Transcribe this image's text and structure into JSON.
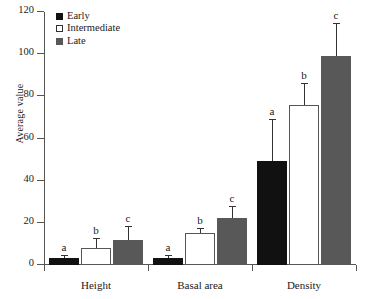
{
  "chart_data": {
    "type": "bar",
    "title": "",
    "xlabel": "",
    "ylabel": "Average value",
    "ylim": [
      0,
      120
    ],
    "ytick_values": [
      0,
      20,
      40,
      60,
      80,
      100,
      120
    ],
    "ytick_labels": [
      "0",
      "20",
      "40",
      "60",
      "80",
      "100",
      "120"
    ],
    "grid": false,
    "legend_position": "top-left",
    "categories": [
      "Height",
      "Basal area",
      "Density"
    ],
    "series": [
      {
        "name": "Early",
        "color": "#111111",
        "values": [
          3.5,
          3.5,
          49.5
        ],
        "errors_upper": [
          0.8,
          0.8,
          19.5
        ],
        "annotations": [
          "a",
          "a",
          "a"
        ]
      },
      {
        "name": "Intermediate",
        "color": "#ffffff",
        "values": [
          8.3,
          15.0,
          76.0
        ],
        "errors_upper": [
          4.0,
          2.3,
          10.0
        ],
        "annotations": [
          "b",
          "b",
          "b"
        ]
      },
      {
        "name": "Late",
        "color": "#585858",
        "values": [
          11.8,
          22.2,
          99.0
        ],
        "errors_upper": [
          6.0,
          5.5,
          15.5
        ],
        "annotations": [
          "c",
          "c",
          "c"
        ]
      }
    ]
  },
  "legend": {
    "items": [
      {
        "label": "Early",
        "swatch": "early-swatch"
      },
      {
        "label": "Intermediate",
        "swatch": "intermediate-swatch"
      },
      {
        "label": "Late",
        "swatch": "late-swatch"
      }
    ]
  },
  "axes": {
    "y_title": "Average value"
  }
}
